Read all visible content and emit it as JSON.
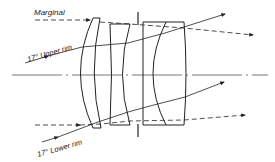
{
  "diagram": {
    "labels": {
      "marginal": "Marginal",
      "upper_rim": "17° Upper rim",
      "lower_rim": "17° Lower rim"
    },
    "elements": [
      "front-meniscus-lens",
      "negative-lens",
      "aperture-stop",
      "cemented-doublet"
    ],
    "colors": {
      "line": "#222222",
      "axis": "#555555",
      "background": "#ffffff"
    }
  }
}
